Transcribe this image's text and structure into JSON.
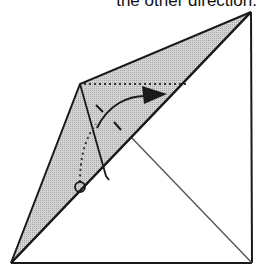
{
  "caption": "the other direction.",
  "diagram": {
    "type": "origami-fold-step",
    "colors": {
      "line": "#1a1a1a",
      "thin_line": "#555555",
      "shade": "#c8c8c8",
      "background": "#ffffff"
    },
    "markers": {
      "fold_arrow": "curved-arrow-right",
      "pivot_point": "circle-marker"
    }
  }
}
